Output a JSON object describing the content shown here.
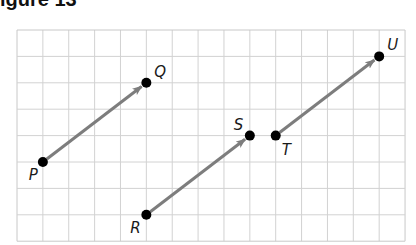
{
  "figure": {
    "title": "igure 13",
    "grid": {
      "cols": 15,
      "rows": 8,
      "origin_px": [
        17,
        30
      ],
      "cell_px": [
        25.87,
        26.4
      ],
      "line_color": "#d2d2d2",
      "border_color": "#c8c8c8"
    },
    "arrow_color": "#7d7d7d",
    "point_color": "#000000",
    "points": [
      {
        "name": "P",
        "col": 1,
        "row": 5,
        "label_dx": -14,
        "label_dy": 18
      },
      {
        "name": "Q",
        "col": 5,
        "row": 2,
        "label_dx": 8,
        "label_dy": -6
      },
      {
        "name": "R",
        "col": 5,
        "row": 7,
        "label_dx": -16,
        "label_dy": 18
      },
      {
        "name": "S",
        "col": 9,
        "row": 4,
        "label_dx": -16,
        "label_dy": -6
      },
      {
        "name": "T",
        "col": 10,
        "row": 4,
        "label_dx": 6,
        "label_dy": 19
      },
      {
        "name": "U",
        "col": 14,
        "row": 1,
        "label_dx": 8,
        "label_dy": -6
      }
    ],
    "vectors": [
      {
        "from": "P",
        "to": "Q",
        "dx": 4,
        "dy": 3
      },
      {
        "from": "R",
        "to": "S",
        "dx": 4,
        "dy": 3
      },
      {
        "from": "T",
        "to": "U",
        "dx": 4,
        "dy": 3
      }
    ]
  }
}
